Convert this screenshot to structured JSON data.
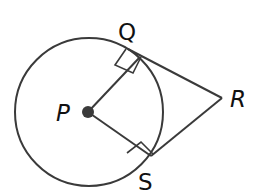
{
  "diagram": {
    "labels": {
      "P": "P",
      "Q": "Q",
      "R": "R",
      "S": "S"
    },
    "elements": {
      "circle": "circle centered at P",
      "radius_PQ": "radius PQ",
      "radius_PS": "radius PS",
      "tangent_QR": "tangent segment QR",
      "tangent_SR": "tangent segment SR",
      "right_angle_Q": "right angle at Q",
      "right_angle_S": "right angle at S"
    },
    "colors": {
      "stroke": "#3a3a3a",
      "point": "#3a3a3a",
      "text": "#111111",
      "background": "#ffffff"
    }
  }
}
